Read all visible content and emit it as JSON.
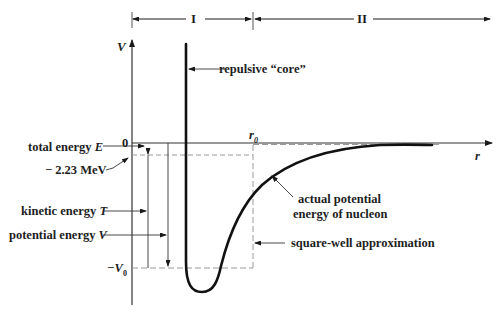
{
  "regions": [
    {
      "label": "I",
      "x_start": 132,
      "x_end": 253
    },
    {
      "label": "II",
      "x_start": 253,
      "x_end": 490
    }
  ],
  "axes": {
    "y_label": "V",
    "x_label": "r",
    "zero_label": "0",
    "r0_label": "r",
    "r0_sub": "0",
    "minus_v0_label": "−V",
    "minus_v0_sub": "0"
  },
  "annotations": {
    "core": "repulsive “core”",
    "actual_line1": "actual potential",
    "actual_line2": "energy of nucleon",
    "square_well": "square-well approximation",
    "total_energy_text": "total energy ",
    "total_energy_sym": "E",
    "binding": "− 2.23 MeV",
    "kinetic_text": "kinetic energy ",
    "kinetic_sym": "T",
    "potential_text": "potential energy ",
    "potential_sym": "V"
  },
  "colors": {
    "ink": "#1a1a1a",
    "dashed": "#9a9a9a",
    "background": "#ffffff"
  }
}
